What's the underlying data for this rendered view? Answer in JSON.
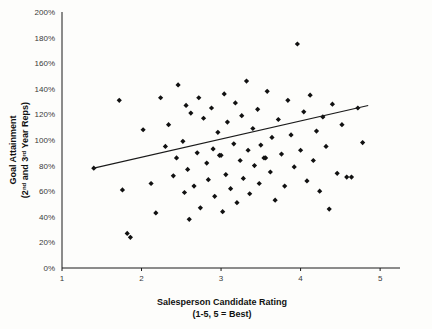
{
  "chart_data": {
    "type": "scatter",
    "title": "",
    "subtitle": "",
    "xlabel": "Salesperson Candidate Rating",
    "xlabel_line2": "(1-5, 5 = Best)",
    "ylabel": "Goal Attainment",
    "ylabel_line2": "(2nd and 3rd Year Reps)",
    "ylabel_line2_parts": {
      "prefix": "(2",
      "sup1": "nd",
      "mid": " and 3",
      "sup2": "rd",
      "suffix": " Year Reps)"
    },
    "xlim": [
      1,
      5.25
    ],
    "ylim": [
      0,
      2.0
    ],
    "xticks": [
      1,
      2,
      3,
      4,
      5
    ],
    "xticklabels": [
      "1",
      "2",
      "3",
      "4",
      "5"
    ],
    "yticks": [
      0,
      0.2,
      0.4,
      0.6,
      0.8,
      1.0,
      1.2,
      1.4,
      1.6,
      1.8,
      2.0
    ],
    "yticklabels": [
      "0%",
      "20%",
      "40%",
      "60%",
      "80%",
      "100%",
      "120%",
      "140%",
      "160%",
      "180%",
      "200%"
    ],
    "grid": false,
    "legend": false,
    "marker_color": "#111111",
    "marker_shape": "diamond",
    "marker_size": 2.6,
    "trendline": {
      "visible": true,
      "color": "#1a1a1a",
      "x_start": 1.4,
      "y_start": 0.78,
      "x_end": 4.85,
      "y_end": 1.27
    },
    "series": [
      {
        "name": "Salespeople",
        "points": [
          [
            1.4,
            0.78
          ],
          [
            1.72,
            1.31
          ],
          [
            1.76,
            0.61
          ],
          [
            1.82,
            0.27
          ],
          [
            1.86,
            0.24
          ],
          [
            2.02,
            1.08
          ],
          [
            2.12,
            0.66
          ],
          [
            2.18,
            0.43
          ],
          [
            2.24,
            1.33
          ],
          [
            2.3,
            0.95
          ],
          [
            2.34,
            1.12
          ],
          [
            2.4,
            0.72
          ],
          [
            2.44,
            0.86
          ],
          [
            2.46,
            1.43
          ],
          [
            2.52,
            0.99
          ],
          [
            2.54,
            0.59
          ],
          [
            2.56,
            1.27
          ],
          [
            2.58,
            0.77
          ],
          [
            2.6,
            0.38
          ],
          [
            2.62,
            1.21
          ],
          [
            2.66,
            0.64
          ],
          [
            2.7,
            0.9
          ],
          [
            2.72,
            1.33
          ],
          [
            2.74,
            0.47
          ],
          [
            2.78,
            1.17
          ],
          [
            2.82,
            0.82
          ],
          [
            2.84,
            0.69
          ],
          [
            2.88,
            1.25
          ],
          [
            2.9,
            0.93
          ],
          [
            2.92,
            0.56
          ],
          [
            2.96,
            1.06
          ],
          [
            2.98,
            0.88
          ],
          [
            3.0,
            0.88
          ],
          [
            3.02,
            0.44
          ],
          [
            3.04,
            1.36
          ],
          [
            3.06,
            0.73
          ],
          [
            3.08,
            1.14
          ],
          [
            3.12,
            0.62
          ],
          [
            3.16,
            0.97
          ],
          [
            3.18,
            1.29
          ],
          [
            3.2,
            0.51
          ],
          [
            3.24,
            0.84
          ],
          [
            3.26,
            1.19
          ],
          [
            3.28,
            0.7
          ],
          [
            3.32,
            1.46
          ],
          [
            3.34,
            0.92
          ],
          [
            3.36,
            0.58
          ],
          [
            3.4,
            1.09
          ],
          [
            3.42,
            0.8
          ],
          [
            3.46,
            1.24
          ],
          [
            3.48,
            0.66
          ],
          [
            3.5,
            0.96
          ],
          [
            3.54,
            0.86
          ],
          [
            3.56,
            0.86
          ],
          [
            3.58,
            1.38
          ],
          [
            3.62,
            0.75
          ],
          [
            3.64,
            1.02
          ],
          [
            3.68,
            0.53
          ],
          [
            3.72,
            1.16
          ],
          [
            3.76,
            0.89
          ],
          [
            3.8,
            0.64
          ],
          [
            3.84,
            1.31
          ],
          [
            3.88,
            1.04
          ],
          [
            3.92,
            0.79
          ],
          [
            3.96,
            1.75
          ],
          [
            4.0,
            0.92
          ],
          [
            4.04,
            1.22
          ],
          [
            4.08,
            0.68
          ],
          [
            4.12,
            1.35
          ],
          [
            4.16,
            0.84
          ],
          [
            4.2,
            1.07
          ],
          [
            4.24,
            0.6
          ],
          [
            4.28,
            1.18
          ],
          [
            4.32,
            0.95
          ],
          [
            4.36,
            0.46
          ],
          [
            4.4,
            1.28
          ],
          [
            4.46,
            0.74
          ],
          [
            4.52,
            1.12
          ],
          [
            4.58,
            0.71
          ],
          [
            4.64,
            0.71
          ],
          [
            4.72,
            1.25
          ],
          [
            4.78,
            0.98
          ]
        ]
      }
    ]
  }
}
